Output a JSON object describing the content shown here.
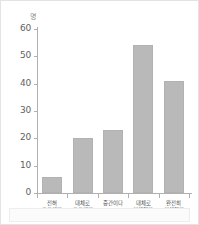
{
  "chart_data": {
    "type": "bar",
    "title": "",
    "subtitle": "",
    "xlabel": "",
    "ylabel": "",
    "unit_label": "명",
    "categories": [
      "전혀\n모르겠다",
      "대체로\n모르겠다",
      "중간이다",
      "대체로\n이해했다",
      "완전히\n이해했다"
    ],
    "category_lines": [
      [
        "전혀",
        "모르겠다"
      ],
      [
        "대체로",
        "모르겠다"
      ],
      [
        "중간이다"
      ],
      [
        "대체로",
        "이해했다"
      ],
      [
        "완전히",
        "이해했다"
      ]
    ],
    "values": [
      6,
      20,
      23,
      54,
      41
    ],
    "ylim": [
      0,
      60
    ],
    "yticks": [
      0,
      10,
      20,
      30,
      40,
      50,
      60
    ],
    "ytick_labels": [
      "0",
      "10",
      "20",
      "30",
      "40",
      "50",
      "60"
    ],
    "grid": false,
    "legend": null,
    "bar_color": "#b9b9b9",
    "axis_color": "#b0b0b0",
    "text_color": "#4d4d4d",
    "background": "#ffffff"
  }
}
